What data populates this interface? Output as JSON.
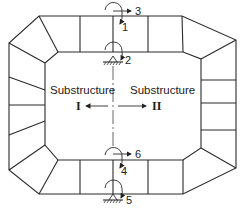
{
  "diagram": {
    "type": "substructure decomposition of a closed frame",
    "substructures": [
      {
        "label": "Substructure",
        "id": "I",
        "arrow_direction": "left"
      },
      {
        "label": "Substructure",
        "id": "II",
        "arrow_direction": "right"
      }
    ],
    "dof_labels": {
      "top_translation": "3",
      "top_rotation_upper": "1",
      "top_support_rotation": "2",
      "bottom_translation": "6",
      "bottom_rotation_upper": "4",
      "bottom_support_rotation": "5"
    },
    "supports": [
      {
        "name": "top-support",
        "type": "pinned-hatched"
      },
      {
        "name": "bottom-support",
        "type": "pinned-hatched"
      }
    ],
    "divider_line": "dash-dot vertical center line",
    "stroke_color": "#2a2a2a",
    "background": "#ffffff"
  }
}
